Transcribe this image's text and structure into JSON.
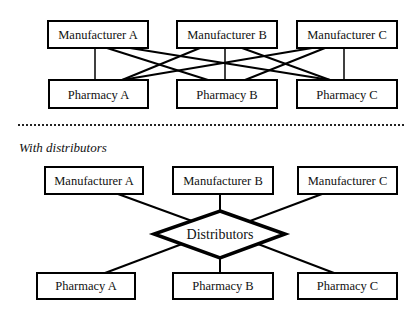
{
  "without_distributors": {
    "manufacturers": [
      {
        "label": "Manufacturer A"
      },
      {
        "label": "Manufacturer B"
      },
      {
        "label": "Manufacturer C"
      }
    ],
    "pharmacies": [
      {
        "label": "Pharmacy A"
      },
      {
        "label": "Pharmacy B"
      },
      {
        "label": "Pharmacy C"
      }
    ],
    "connections": "every manufacturer connected to every pharmacy"
  },
  "with_distributors": {
    "section_label": "With distributors",
    "manufacturers": [
      {
        "label": "Manufacturer A"
      },
      {
        "label": "Manufacturer B"
      },
      {
        "label": "Manufacturer C"
      }
    ],
    "hub": {
      "label": "Distributors",
      "shape": "diamond"
    },
    "pharmacies": [
      {
        "label": "Pharmacy A"
      },
      {
        "label": "Pharmacy B"
      },
      {
        "label": "Pharmacy C"
      }
    ],
    "connections": "every manufacturer and pharmacy connected through distributors"
  },
  "colors": {
    "stroke": "#000000",
    "background": "#ffffff"
  }
}
